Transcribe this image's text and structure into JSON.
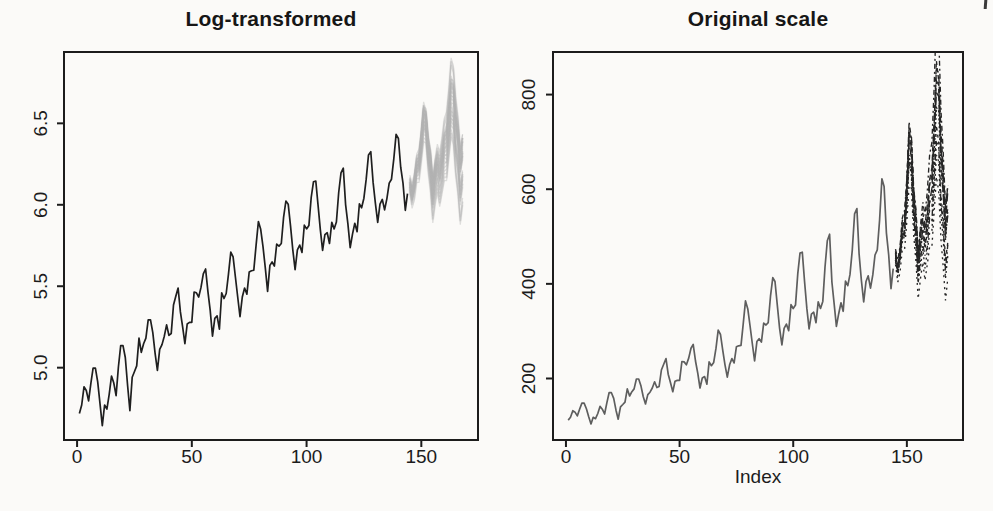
{
  "figure": {
    "background": "#fbfaf8",
    "ink": "#1c1c1c",
    "page_artifact_present": true
  },
  "chart_data": [
    {
      "type": "line",
      "title": "Log-transformed",
      "xlabel": "",
      "ylabel": "",
      "transform": "log",
      "xlim": [
        -5.7,
        174.7
      ],
      "ylim": [
        4.556,
        6.938
      ],
      "x_ticks": [
        0,
        50,
        100,
        150
      ],
      "x_tick_labels": [
        "0",
        "50",
        "100",
        "150"
      ],
      "y_ticks": [
        5.0,
        5.5,
        6.0,
        6.5
      ],
      "y_tick_labels": [
        "5.0",
        "5.5",
        "6.0",
        "6.5"
      ],
      "grid": false,
      "legend": "none",
      "observed_color": "#1f1f1f",
      "forecast_color": "#b2b2b2",
      "forecast_style": "fuzzy-gray-cloud"
    },
    {
      "type": "line",
      "title": "Original scale",
      "xlabel": "Index",
      "ylabel": "",
      "transform": "identity",
      "xlim": [
        -5.7,
        174.7
      ],
      "ylim": [
        70,
        890
      ],
      "x_ticks": [
        0,
        50,
        100,
        150
      ],
      "x_tick_labels": [
        "0",
        "50",
        "100",
        "150"
      ],
      "y_ticks": [
        200,
        400,
        600,
        800
      ],
      "y_tick_labels": [
        "200",
        "400",
        "600",
        "800"
      ],
      "grid": false,
      "legend": "none",
      "observed_color": "#5e5e5e",
      "forecast_color": "#262626",
      "forecast_style": "dark-dashed-paths-clipped"
    }
  ],
  "series": {
    "observed": [
      112,
      118,
      132,
      129,
      121,
      135,
      148,
      148,
      136,
      119,
      104,
      118,
      115,
      126,
      141,
      135,
      125,
      149,
      170,
      170,
      158,
      133,
      114,
      140,
      145,
      150,
      178,
      163,
      172,
      178,
      199,
      199,
      184,
      162,
      146,
      166,
      171,
      180,
      193,
      181,
      183,
      218,
      230,
      242,
      209,
      191,
      172,
      194,
      196,
      196,
      236,
      235,
      229,
      243,
      264,
      272,
      237,
      211,
      180,
      201,
      204,
      188,
      235,
      227,
      234,
      264,
      302,
      293,
      259,
      229,
      203,
      229,
      242,
      233,
      267,
      269,
      270,
      315,
      364,
      347,
      312,
      274,
      237,
      278,
      284,
      277,
      317,
      313,
      318,
      374,
      413,
      405,
      355,
      306,
      271,
      306,
      315,
      301,
      356,
      348,
      355,
      422,
      465,
      467,
      404,
      347,
      305,
      336,
      340,
      318,
      362,
      348,
      363,
      435,
      491,
      505,
      404,
      359,
      310,
      337,
      360,
      342,
      406,
      396,
      420,
      472,
      548,
      559,
      463,
      407,
      362,
      405,
      417,
      391,
      419,
      461,
      472,
      535,
      622,
      606,
      508,
      461,
      390,
      432
    ],
    "forecast_start_index": 145,
    "forecast_mean_log": [
      6.13,
      6.06,
      6.13,
      6.23,
      6.25,
      6.38,
      6.53,
      6.5,
      6.33,
      6.23,
      6.06,
      6.16,
      6.23,
      6.16,
      6.23,
      6.33,
      6.35,
      6.48,
      6.63,
      6.6,
      6.43,
      6.33,
      6.16,
      6.26
    ],
    "forecast_offsets_log": [
      [
        0.01,
        0.03,
        0.02,
        0.05,
        0.04,
        0.06,
        0.05,
        0.07,
        0.06,
        0.08,
        0.07,
        0.09,
        0.08,
        0.1,
        0.11,
        0.1,
        0.12,
        0.13,
        0.12,
        0.14,
        0.15,
        0.14,
        0.16,
        0.15
      ],
      [
        -0.02,
        -0.03,
        -0.01,
        -0.04,
        -0.03,
        -0.05,
        -0.04,
        -0.06,
        -0.05,
        -0.07,
        -0.06,
        -0.08,
        -0.07,
        -0.09,
        -0.08,
        -0.1,
        -0.11,
        -0.1,
        -0.12,
        -0.11,
        -0.13,
        -0.12,
        -0.14,
        -0.13
      ],
      [
        0.02,
        0.0,
        0.03,
        0.01,
        0.04,
        0.02,
        0.05,
        0.03,
        0.06,
        0.04,
        0.07,
        0.05,
        0.06,
        0.08,
        0.07,
        0.09,
        0.08,
        0.1,
        0.09,
        0.11,
        0.1,
        0.12,
        0.11,
        0.13
      ],
      [
        -0.01,
        0.01,
        -0.02,
        0.0,
        -0.03,
        -0.01,
        -0.04,
        -0.02,
        -0.05,
        -0.03,
        -0.06,
        -0.04,
        -0.05,
        -0.03,
        -0.06,
        -0.04,
        -0.07,
        -0.05,
        -0.08,
        -0.06,
        -0.09,
        -0.07,
        -0.1,
        -0.08
      ],
      [
        0.0,
        0.02,
        0.01,
        0.03,
        0.02,
        0.04,
        0.06,
        0.04,
        0.03,
        0.05,
        0.04,
        0.06,
        0.05,
        0.07,
        0.06,
        0.08,
        0.1,
        0.12,
        0.14,
        0.12,
        0.1,
        0.08,
        0.09,
        0.07
      ],
      [
        -0.03,
        -0.01,
        -0.02,
        0.0,
        -0.01,
        -0.03,
        -0.02,
        -0.04,
        -0.03,
        -0.01,
        -0.02,
        0.0,
        -0.01,
        0.01,
        0.0,
        0.02,
        0.01,
        0.03,
        0.02,
        0.04,
        0.03,
        0.05,
        0.04,
        0.06
      ],
      [
        0.01,
        -0.01,
        0.0,
        -0.02,
        -0.01,
        0.01,
        0.02,
        0.0,
        0.01,
        -0.01,
        0.0,
        0.02,
        0.01,
        0.03,
        0.04,
        0.02,
        0.05,
        0.07,
        0.06,
        0.08,
        0.07,
        0.05,
        0.06,
        0.04
      ],
      [
        -0.02,
        0.0,
        -0.01,
        0.01,
        0.0,
        0.02,
        0.03,
        0.05,
        0.04,
        0.02,
        0.03,
        0.01,
        0.02,
        0.0,
        0.01,
        -0.01,
        -0.02,
        -0.04,
        -0.03,
        -0.05,
        -0.06,
        -0.04,
        -0.05,
        -0.07
      ],
      [
        0.03,
        0.05,
        0.04,
        0.06,
        0.07,
        0.05,
        0.08,
        0.06,
        0.07,
        0.09,
        0.08,
        0.1,
        0.12,
        0.14,
        0.16,
        0.18,
        0.2,
        0.22,
        0.25,
        0.23,
        0.21,
        0.19,
        0.17,
        0.15
      ],
      [
        -0.04,
        -0.06,
        -0.08,
        -0.07,
        -0.09,
        -0.1,
        -0.12,
        -0.1,
        -0.11,
        -0.13,
        -0.15,
        -0.14,
        -0.13,
        -0.15,
        -0.14,
        -0.16,
        -0.18,
        -0.17,
        -0.19,
        -0.21,
        -0.23,
        -0.25,
        -0.26,
        -0.24
      ]
    ]
  }
}
